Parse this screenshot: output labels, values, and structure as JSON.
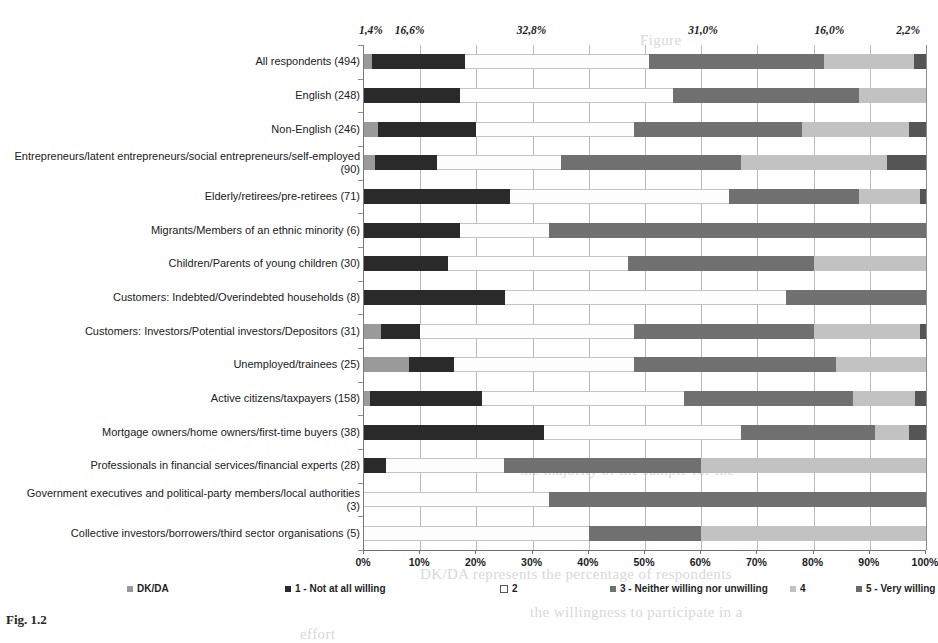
{
  "chart_data": {
    "type": "bar",
    "subtype": "stacked-horizontal-100",
    "title": "",
    "xlabel": "",
    "ylabel": "",
    "xlim": [
      0,
      100
    ],
    "xticks": [
      "0%",
      "10%",
      "20%",
      "30%",
      "40%",
      "50%",
      "60%",
      "70%",
      "80%",
      "90%",
      "100%"
    ],
    "grid": true,
    "legend_position": "bottom",
    "top_value_labels": [
      "1,4%",
      "16,6%",
      "32,8%",
      "31,0%",
      "16,0%",
      "2,2%"
    ],
    "top_value_positions": [
      1.4,
      8.3,
      30.0,
      60.5,
      83.0,
      97.0
    ],
    "series": [
      {
        "name": "DK/DA",
        "color": "#9a9a9a"
      },
      {
        "name": "1 - Not at all willing",
        "color": "#2a2a2a"
      },
      {
        "name": "2",
        "color": "#ffffff"
      },
      {
        "name": "3 - Neither willing nor unwilling",
        "color": "#707070"
      },
      {
        "name": "4",
        "color": "#c2c2c2"
      },
      {
        "name": "5 - Very willing",
        "color": "#555555"
      }
    ],
    "categories": [
      "All respondents (494)",
      "English (248)",
      "Non-English (246)",
      "Entrepreneurs/latent entrepreneurs/social entrepreneurs/self-employed (90)",
      "Elderly/retirees/pre-retirees (71)",
      "Migrants/Members of an ethnic minority (6)",
      "Children/Parents of young children (30)",
      "Customers: Indebted/Overindebted households (8)",
      "Customers: Investors/Potential investors/Depositors (31)",
      "Unemployed/trainees (25)",
      "Active citizens/taxpayers (158)",
      "Mortgage owners/home owners/first-time buyers (38)",
      "Professionals in financial services/financial experts (28)",
      "Government executives and political-party members/local authorities (3)",
      "Collective investors/borrowers/third sector organisations (5)"
    ],
    "values": [
      [
        1.4,
        16.6,
        32.8,
        31.0,
        16.0,
        2.2
      ],
      [
        0.0,
        17.0,
        38.0,
        33.0,
        12.0,
        0.0
      ],
      [
        2.5,
        17.5,
        28.0,
        30.0,
        19.0,
        3.0
      ],
      [
        2.0,
        11.0,
        22.0,
        32.0,
        26.0,
        7.0
      ],
      [
        0.0,
        26.0,
        39.0,
        23.0,
        11.0,
        1.0
      ],
      [
        0.0,
        17.0,
        16.0,
        67.0,
        0.0,
        0.0
      ],
      [
        0.0,
        15.0,
        32.0,
        33.0,
        20.0,
        0.0
      ],
      [
        0.0,
        25.0,
        50.0,
        25.0,
        0.0,
        0.0
      ],
      [
        3.0,
        7.0,
        38.0,
        32.0,
        19.0,
        1.0
      ],
      [
        8.0,
        8.0,
        32.0,
        36.0,
        16.0,
        0.0
      ],
      [
        1.0,
        20.0,
        36.0,
        30.0,
        11.0,
        2.0
      ],
      [
        0.0,
        32.0,
        35.0,
        24.0,
        6.0,
        3.0
      ],
      [
        0.0,
        4.0,
        21.0,
        35.0,
        40.0,
        0.0
      ],
      [
        0.0,
        0.0,
        33.0,
        67.0,
        0.0,
        0.0
      ],
      [
        0.0,
        0.0,
        40.0,
        20.0,
        40.0,
        0.0
      ]
    ]
  },
  "legend": {
    "items": [
      {
        "label": "DK/DA",
        "swatch": "sw-dkda"
      },
      {
        "label": "1 - Not at all willing",
        "swatch": "sw-1"
      },
      {
        "label": "2",
        "swatch": "sw-2"
      },
      {
        "label": "3 - Neither willing nor unwilling",
        "swatch": "sw-3"
      },
      {
        "label": "4",
        "swatch": "sw-4"
      },
      {
        "label": "5 - Very willing",
        "swatch": "sw-5"
      }
    ],
    "positions": [
      127,
      285,
      500,
      610,
      790,
      856
    ]
  },
  "caption": {
    "text": "Fig. 1.2"
  },
  "ghost": {
    "line_right": "Figure",
    "line_mid": "",
    "line_bottom_a": "the majority of the sample for the",
    "line_bottom_b": "the willingness to participate in a",
    "line_bottom_c": "effort",
    "line_caption": "DK/DA represents the percentage of respondents"
  }
}
